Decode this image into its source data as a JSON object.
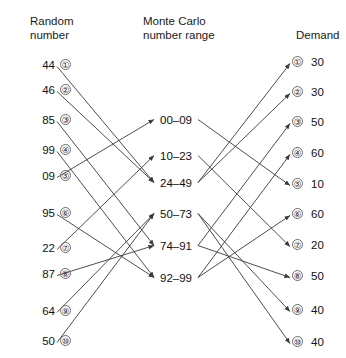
{
  "headers": {
    "left": "Random\nnumber",
    "middle": "Monte Carlo\nnumber range",
    "right": "Demand"
  },
  "chart_data": {
    "type": "diagram",
    "columns": [
      "Random number",
      "Monte Carlo number range",
      "Demand"
    ],
    "left_nodes": [
      {
        "index": "①",
        "value": "44",
        "y": 65
      },
      {
        "index": "②",
        "value": "46",
        "y": 90
      },
      {
        "index": "③",
        "value": "85",
        "y": 120
      },
      {
        "index": "④",
        "value": "99",
        "y": 150
      },
      {
        "index": "⑤",
        "value": "09",
        "y": 176
      },
      {
        "index": "⑥",
        "value": "95",
        "y": 213
      },
      {
        "index": "⑦",
        "value": "22",
        "y": 248
      },
      {
        "index": "⑧",
        "value": "87",
        "y": 274
      },
      {
        "index": "⑨",
        "value": "64",
        "y": 311
      },
      {
        "index": "⑩",
        "value": "50",
        "y": 341
      }
    ],
    "middle_nodes": [
      {
        "label": "00–09",
        "y": 120
      },
      {
        "label": "10–23",
        "y": 156
      },
      {
        "label": "24–49",
        "y": 183
      },
      {
        "label": "50–73",
        "y": 214
      },
      {
        "label": "74–91",
        "y": 246
      },
      {
        "label": "92–99",
        "y": 278
      }
    ],
    "right_nodes": [
      {
        "index": "①",
        "value": "30",
        "y": 62
      },
      {
        "index": "②",
        "value": "30",
        "y": 92
      },
      {
        "index": "③",
        "value": "50",
        "y": 122
      },
      {
        "index": "④",
        "value": "60",
        "y": 153
      },
      {
        "index": "⑤",
        "value": "10",
        "y": 184
      },
      {
        "index": "⑥",
        "value": "60",
        "y": 214
      },
      {
        "index": "⑦",
        "value": "20",
        "y": 245
      },
      {
        "index": "⑧",
        "value": "50",
        "y": 276
      },
      {
        "index": "⑨",
        "value": "40",
        "y": 310
      },
      {
        "index": "⑩",
        "value": "40",
        "y": 342
      }
    ],
    "links_left_to_middle": [
      {
        "from": "44",
        "to": "24–49"
      },
      {
        "from": "46",
        "to": "24–49"
      },
      {
        "from": "85",
        "to": "74–91"
      },
      {
        "from": "99",
        "to": "92–99"
      },
      {
        "from": "09",
        "to": "00–09"
      },
      {
        "from": "95",
        "to": "92–99"
      },
      {
        "from": "22",
        "to": "10–23"
      },
      {
        "from": "87",
        "to": "74–91"
      },
      {
        "from": "64",
        "to": "50–73"
      },
      {
        "from": "50",
        "to": "50–73"
      }
    ],
    "links_middle_to_right": [
      {
        "from": "24–49",
        "to": "30",
        "index": "①"
      },
      {
        "from": "24–49",
        "to": "30",
        "index": "②"
      },
      {
        "from": "74–91",
        "to": "50",
        "index": "③"
      },
      {
        "from": "92–99",
        "to": "60",
        "index": "④"
      },
      {
        "from": "00–09",
        "to": "10",
        "index": "⑤"
      },
      {
        "from": "92–99",
        "to": "60",
        "index": "⑥"
      },
      {
        "from": "10–23",
        "to": "20",
        "index": "⑦"
      },
      {
        "from": "74–91",
        "to": "50",
        "index": "⑧"
      },
      {
        "from": "50–73",
        "to": "40",
        "index": "⑨"
      },
      {
        "from": "50–73",
        "to": "40",
        "index": "⑩"
      }
    ],
    "stroke_color": "#3a3a3a"
  }
}
